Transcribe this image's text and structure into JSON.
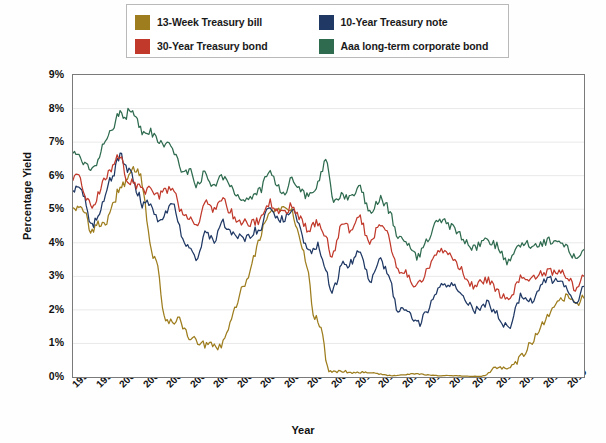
{
  "chart_data": {
    "type": "line",
    "title": "",
    "xlabel": "Year",
    "ylabel": "Percentage Yield",
    "ylim": [
      0,
      9
    ],
    "xlim": [
      1998,
      2019.7
    ],
    "grid": true,
    "legend_position": "top",
    "ytick_labels": [
      "9%",
      "8%",
      "7%",
      "6%",
      "5%",
      "4%",
      "3%",
      "2%",
      "1%",
      "0%"
    ],
    "ytick_values": [
      9,
      8,
      7,
      6,
      5,
      4,
      3,
      2,
      1,
      0
    ],
    "xtick_labels": [
      "1998",
      "1999",
      "2000",
      "2001",
      "2002",
      "2003",
      "2004",
      "2005",
      "2006",
      "2007",
      "2008",
      "2009",
      "2010",
      "2011",
      "2012",
      "2013",
      "2014",
      "2015",
      "2016",
      "2017",
      "2018",
      "2019"
    ],
    "series": [
      {
        "name": "13-Week Treasury bill",
        "color": "#9d7d1e",
        "x": [
          1998.0,
          1998.25,
          1998.5,
          1998.75,
          1999.0,
          1999.25,
          1999.5,
          1999.75,
          2000.0,
          2000.25,
          2000.5,
          2000.75,
          2001.0,
          2001.2,
          2001.4,
          2001.6,
          2001.8,
          2002.0,
          2002.3,
          2002.6,
          2003.0,
          2003.3,
          2003.6,
          2004.0,
          2004.3,
          2004.6,
          2005.0,
          2005.3,
          2005.6,
          2006.0,
          2006.3,
          2006.6,
          2007.0,
          2007.3,
          2007.6,
          2008.0,
          2008.2,
          2008.4,
          2008.6,
          2008.8,
          2009.0,
          2009.5,
          2010.0,
          2010.5,
          2011.0,
          2011.5,
          2012.0,
          2012.5,
          2013.0,
          2013.5,
          2014.0,
          2014.5,
          2015.0,
          2015.5,
          2016.0,
          2016.5,
          2017.0,
          2017.5,
          2018.0,
          2018.5,
          2019.0,
          2019.4,
          2019.7
        ],
        "values": [
          5.1,
          5.0,
          4.9,
          4.4,
          4.5,
          4.6,
          4.7,
          5.2,
          5.7,
          5.8,
          6.1,
          6.2,
          5.6,
          4.3,
          3.6,
          3.3,
          2.1,
          1.7,
          1.7,
          1.6,
          1.15,
          1.05,
          0.95,
          0.92,
          0.95,
          1.4,
          2.3,
          2.8,
          3.4,
          4.3,
          4.8,
          5.0,
          5.0,
          4.9,
          4.2,
          3.1,
          1.9,
          1.7,
          1.2,
          0.3,
          0.18,
          0.17,
          0.13,
          0.15,
          0.09,
          0.04,
          0.07,
          0.1,
          0.07,
          0.04,
          0.04,
          0.03,
          0.02,
          0.05,
          0.3,
          0.3,
          0.6,
          1.05,
          1.6,
          2.1,
          2.4,
          2.2,
          2.35
        ]
      },
      {
        "name": "10-Year Treasury note",
        "color": "#1f3864",
        "x": [
          1998.0,
          1998.25,
          1998.5,
          1998.75,
          1999.0,
          1999.25,
          1999.5,
          1999.75,
          2000.0,
          2000.25,
          2000.5,
          2000.75,
          2001.0,
          2001.3,
          2001.6,
          2002.0,
          2002.3,
          2002.6,
          2003.0,
          2003.3,
          2003.6,
          2004.0,
          2004.3,
          2004.6,
          2005.0,
          2005.3,
          2005.6,
          2006.0,
          2006.3,
          2006.6,
          2007.0,
          2007.3,
          2007.6,
          2008.0,
          2008.4,
          2008.8,
          2009.0,
          2009.4,
          2009.8,
          2010.2,
          2010.6,
          2011.0,
          2011.4,
          2011.8,
          2012.2,
          2012.6,
          2013.0,
          2013.5,
          2014.0,
          2014.5,
          2015.0,
          2015.5,
          2016.0,
          2016.5,
          2017.0,
          2017.5,
          2018.0,
          2018.5,
          2019.0,
          2019.4,
          2019.7
        ],
        "values": [
          5.6,
          5.7,
          5.3,
          4.5,
          4.7,
          5.2,
          5.8,
          6.1,
          6.6,
          6.2,
          6.0,
          5.5,
          5.1,
          5.2,
          4.7,
          5.0,
          5.1,
          4.2,
          3.9,
          3.5,
          4.3,
          4.1,
          4.6,
          4.3,
          4.2,
          4.1,
          4.3,
          4.5,
          5.1,
          4.8,
          4.7,
          5.0,
          4.5,
          3.7,
          3.9,
          3.0,
          2.5,
          3.3,
          3.4,
          3.7,
          2.9,
          3.5,
          3.0,
          2.0,
          2.0,
          1.6,
          1.9,
          2.6,
          2.8,
          2.5,
          2.0,
          2.2,
          1.9,
          1.5,
          2.4,
          2.3,
          2.8,
          2.9,
          2.6,
          2.1,
          2.7
        ]
      },
      {
        "name": "30-Year Treasury bond",
        "color": "#c0392b",
        "x": [
          1998.0,
          1998.25,
          1998.5,
          1998.75,
          1999.0,
          1999.25,
          1999.5,
          1999.75,
          2000.0,
          2000.25,
          2000.5,
          2000.75,
          2001.0,
          2001.3,
          2001.6,
          2002.0,
          2002.3,
          2002.6,
          2003.0,
          2003.3,
          2003.6,
          2004.0,
          2004.3,
          2004.6,
          2005.0,
          2005.3,
          2005.6,
          2006.0,
          2006.3,
          2006.6,
          2007.0,
          2007.3,
          2007.6,
          2008.0,
          2008.4,
          2008.8,
          2009.0,
          2009.4,
          2009.8,
          2010.2,
          2010.6,
          2011.0,
          2011.4,
          2011.8,
          2012.2,
          2012.6,
          2013.0,
          2013.5,
          2014.0,
          2014.5,
          2015.0,
          2015.5,
          2016.0,
          2016.5,
          2017.0,
          2017.5,
          2018.0,
          2018.5,
          2019.0,
          2019.4,
          2019.7
        ],
        "values": [
          5.9,
          5.9,
          5.5,
          5.1,
          5.3,
          5.8,
          6.1,
          6.3,
          6.6,
          6.0,
          5.8,
          5.7,
          5.5,
          5.7,
          5.4,
          5.6,
          5.6,
          4.9,
          4.8,
          4.5,
          5.2,
          5.0,
          5.3,
          5.0,
          4.7,
          4.6,
          4.6,
          4.7,
          5.2,
          5.0,
          4.9,
          5.1,
          4.8,
          4.4,
          4.6,
          4.1,
          3.6,
          4.5,
          4.4,
          4.7,
          4.0,
          4.6,
          4.2,
          3.1,
          3.1,
          2.7,
          3.1,
          3.7,
          3.7,
          3.2,
          2.7,
          2.9,
          2.6,
          2.3,
          3.0,
          2.9,
          3.1,
          3.1,
          3.0,
          2.6,
          3.0
        ]
      },
      {
        "name": "Aaa long-term corporate bond",
        "color": "#2f6b4f",
        "x": [
          1998.0,
          1998.25,
          1998.5,
          1998.75,
          1999.0,
          1999.25,
          1999.5,
          1999.75,
          2000.0,
          2000.2,
          2000.4,
          2000.6,
          2000.8,
          2001.0,
          2001.3,
          2001.6,
          2002.0,
          2002.3,
          2002.6,
          2003.0,
          2003.3,
          2003.6,
          2004.0,
          2004.3,
          2004.6,
          2005.0,
          2005.3,
          2005.6,
          2006.0,
          2006.3,
          2006.6,
          2007.0,
          2007.3,
          2007.6,
          2008.0,
          2008.4,
          2008.8,
          2009.0,
          2009.4,
          2009.8,
          2010.2,
          2010.6,
          2011.0,
          2011.4,
          2011.8,
          2012.2,
          2012.6,
          2013.0,
          2013.5,
          2014.0,
          2014.5,
          2015.0,
          2015.5,
          2016.0,
          2016.5,
          2017.0,
          2017.5,
          2018.0,
          2018.5,
          2019.0,
          2019.4,
          2019.7
        ],
        "values": [
          6.7,
          6.6,
          6.4,
          6.2,
          6.4,
          6.9,
          7.3,
          7.5,
          7.9,
          7.7,
          8.0,
          7.7,
          7.5,
          7.2,
          7.3,
          7.0,
          6.9,
          6.7,
          6.2,
          6.1,
          5.7,
          6.1,
          5.7,
          6.0,
          5.8,
          5.4,
          5.3,
          5.4,
          5.6,
          6.1,
          5.8,
          5.5,
          5.9,
          5.6,
          5.4,
          5.8,
          6.4,
          5.3,
          5.4,
          5.3,
          5.6,
          4.9,
          5.3,
          5.0,
          4.2,
          4.0,
          3.6,
          4.0,
          4.6,
          4.5,
          4.2,
          3.8,
          4.1,
          3.9,
          3.4,
          4.0,
          3.9,
          4.0,
          4.1,
          3.9,
          3.5,
          3.8
        ]
      }
    ]
  },
  "legend": {
    "items": [
      {
        "label": "13-Week Treasury bill",
        "color": "#9d7d1e"
      },
      {
        "label": "10-Year Treasury note",
        "color": "#1f3864"
      },
      {
        "label": "30-Year Treasury bond",
        "color": "#c0392b"
      },
      {
        "label": "Aaa long-term corporate bond",
        "color": "#2f6b4f"
      }
    ]
  },
  "axes": {
    "y_title": "Percentage Yield",
    "x_title": "Year"
  }
}
